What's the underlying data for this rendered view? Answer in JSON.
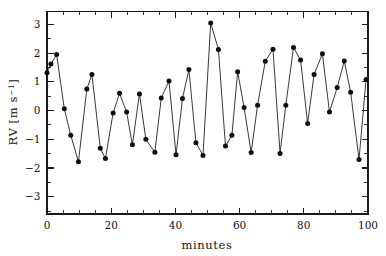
{
  "chart_data": {
    "type": "line",
    "title": "",
    "subtitle": "",
    "xlabel": "minutes",
    "ylabel": "RV [m s^-1]",
    "ylabel_parts": {
      "prefix": "RV  [m s",
      "exponent": "−1",
      "suffix": "]"
    },
    "xlim": [
      0,
      100
    ],
    "ylim": [
      -3.6,
      3.45
    ],
    "grid": false,
    "legend": null,
    "x_ticks_major": [
      0,
      20,
      40,
      60,
      80,
      100
    ],
    "x_tick_labels": [
      "0",
      "20",
      "40",
      "60",
      "80",
      "100"
    ],
    "x_tick_minor_step": 5,
    "y_ticks_major": [
      -3,
      -2,
      -1,
      0,
      1,
      2,
      3
    ],
    "y_tick_labels": [
      "−3",
      "−2",
      "−1",
      "0",
      "1",
      "2",
      "3"
    ],
    "y_tick_minor_step": 0.5,
    "marker": "filled-circle",
    "marker_size_px": 2.5,
    "line_color": "#141414",
    "marker_color": "#0d0d0d",
    "axis_color": "#1a1a1a",
    "background_color": "#ffffff",
    "series": [
      {
        "name": "RV",
        "x": [
          0.0,
          1.2,
          3.0,
          5.4,
          7.4,
          9.8,
          12.4,
          14.0,
          16.6,
          18.2,
          20.6,
          22.6,
          24.8,
          26.6,
          28.8,
          30.8,
          33.6,
          35.6,
          38.0,
          40.2,
          42.2,
          44.2,
          46.4,
          48.6,
          51.0,
          53.4,
          55.6,
          57.6,
          59.4,
          61.4,
          63.6,
          65.6,
          68.0,
          70.4,
          72.6,
          74.4,
          76.8,
          79.0,
          81.2,
          83.2,
          85.8,
          88.0,
          90.4,
          92.6,
          94.6,
          97.2,
          99.4
        ],
        "y": [
          1.32,
          1.62,
          1.95,
          0.06,
          -0.86,
          -1.78,
          0.75,
          1.26,
          -1.31,
          -1.67,
          -0.08,
          0.6,
          -0.05,
          -1.19,
          0.58,
          -1.0,
          -1.45,
          0.44,
          1.03,
          -1.54,
          0.42,
          1.43,
          -1.12,
          -1.56,
          3.05,
          2.13,
          -1.23,
          -0.86,
          1.35,
          0.11,
          -1.46,
          0.19,
          1.72,
          2.14,
          -1.49,
          0.19,
          2.2,
          1.76,
          -0.45,
          1.26,
          1.98,
          -0.05,
          0.8,
          1.73,
          0.64,
          -1.7,
          1.08
        ]
      }
    ]
  },
  "axes": {
    "x_axis_name": "minutes-axis",
    "y_axis_name": "rv-axis"
  }
}
